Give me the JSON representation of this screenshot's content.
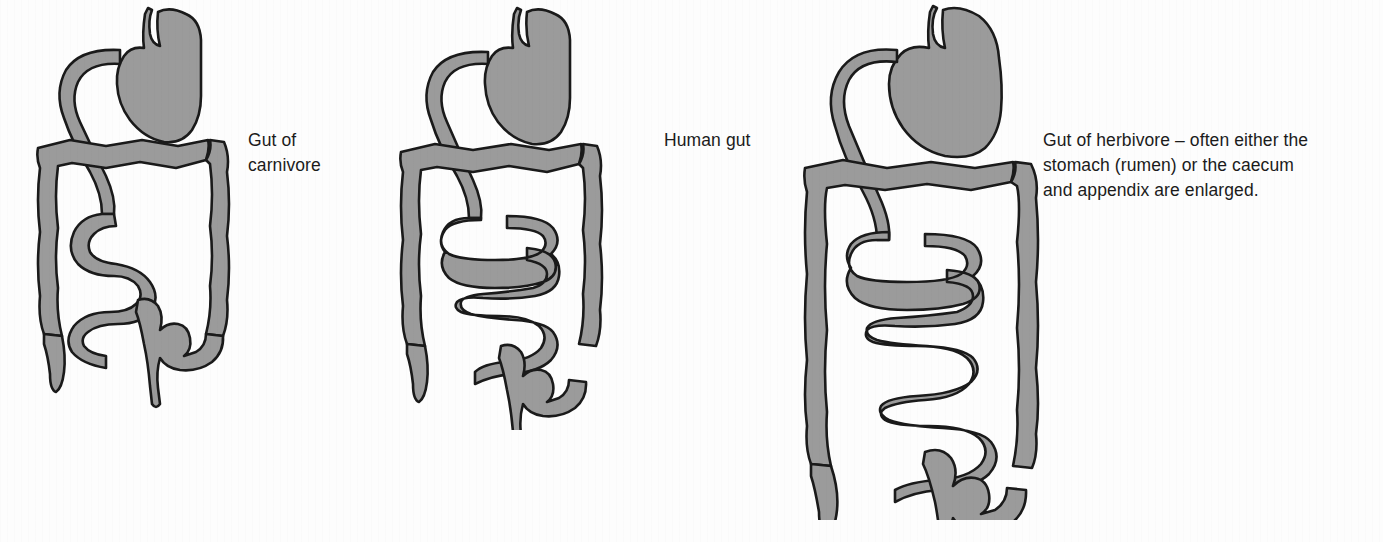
{
  "figures": [
    {
      "id": "carnivore",
      "name": "gut-of-carnivore",
      "caption": "Gut of\ncarnivore",
      "stomach_label": "stomach",
      "features": "short gut, few small-intestine coils, small caecum and appendix"
    },
    {
      "id": "human",
      "name": "human-gut",
      "caption": "Human gut",
      "stomach_label": "stomach",
      "features": "intermediate gut length, moderate small-intestine coiling"
    },
    {
      "id": "herbivore",
      "name": "gut-of-herbivore",
      "caption": "Gut of herbivore – often either the\nstomach (rumen) or the caecum\nand appendix are enlarged.",
      "stomach_label": "stomach (rumen)",
      "features": "long gut, many small-intestine coils, enlarged stomach and caecum"
    }
  ],
  "colors": {
    "organ_fill": "#9b9b9b",
    "organ_outline": "#1a1a1a",
    "background": "#fdfdfd",
    "text": "#1b1b1b"
  }
}
